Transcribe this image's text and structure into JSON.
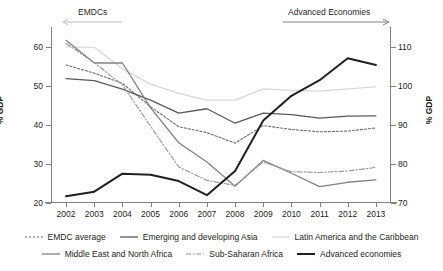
{
  "annotations": {
    "left": {
      "label": "EMDCs",
      "arrow": "arrow-left"
    },
    "right": {
      "label": "Advanced Economies",
      "arrow": "arrow-right"
    }
  },
  "axis": {
    "left_title": "% GDP",
    "right_title": "% GDP",
    "left_ticks": [
      "60",
      "50",
      "40",
      "30",
      "20"
    ],
    "right_ticks": [
      "110",
      "100",
      "90",
      "80",
      "70"
    ]
  },
  "chart_data": {
    "type": "line",
    "title": "",
    "xlabel": "",
    "ylabel": "% GDP",
    "y2label": "% GDP",
    "grid": false,
    "legend_position": "bottom",
    "categories": [
      "2002",
      "2003",
      "2004",
      "2005",
      "2006",
      "2007",
      "2008",
      "2009",
      "2010",
      "2011",
      "2012",
      "2013"
    ],
    "ylim": [
      20,
      65
    ],
    "y2lim": [
      70,
      115
    ],
    "left_tick_values": [
      20,
      30,
      40,
      50,
      60
    ],
    "right_tick_values": [
      70,
      80,
      90,
      100,
      110
    ],
    "series": [
      {
        "name": "EMDC average",
        "axis": "left",
        "style": "dotted",
        "color": "#6d6e71",
        "values": [
          55.3,
          53.2,
          50.6,
          44.6,
          39.5,
          38.0,
          35.3,
          39.8,
          38.8,
          38.2,
          38.4,
          39.2
        ]
      },
      {
        "name": "Emerging and developing Asia",
        "axis": "left",
        "style": "solid",
        "color": "#58595b",
        "values": [
          51.8,
          51.3,
          49.1,
          46.3,
          43.0,
          44.1,
          40.4,
          43.0,
          42.6,
          41.7,
          42.2,
          42.3
        ]
      },
      {
        "name": "Latin America and the Caribbean",
        "axis": "left",
        "style": "solid",
        "color": "#d7d8da",
        "values": [
          59.9,
          59.8,
          54.3,
          50.4,
          48.0,
          46.3,
          46.3,
          49.2,
          48.8,
          48.6,
          49.2,
          49.7
        ]
      },
      {
        "name": "Middle East and North Africa",
        "axis": "left",
        "style": "solid",
        "color": "#808285",
        "values": [
          61.6,
          55.8,
          55.8,
          44.3,
          35.4,
          30.5,
          24.3,
          30.9,
          27.6,
          24.2,
          25.3,
          25.9
        ]
      },
      {
        "name": "Sub-Saharan Africa",
        "axis": "left",
        "style": "dash-dot",
        "color": "#939598",
        "values": [
          60.8,
          55.9,
          50.2,
          39.6,
          29.2,
          25.8,
          24.5,
          30.5,
          28.0,
          27.8,
          28.2,
          29.1
        ]
      },
      {
        "name": "Advanced economies",
        "axis": "right",
        "style": "solid-thick",
        "color": "#231f20",
        "values": [
          71.7,
          72.9,
          77.5,
          77.2,
          75.6,
          72.0,
          78.2,
          91.1,
          97.4,
          101.4,
          107.0,
          105.3
        ]
      }
    ]
  },
  "legend": {
    "row1": [
      {
        "label": "EMDC average",
        "style": "dotted",
        "color": "#6d6e71"
      },
      {
        "label": "Emerging and developing Asia",
        "style": "solid",
        "color": "#58595b"
      },
      {
        "label": "Latin America and the Caribbean",
        "style": "solid",
        "color": "#d7d8da"
      }
    ],
    "row2": [
      {
        "label": "Middle East and North Africa",
        "style": "solid",
        "color": "#808285"
      },
      {
        "label": "Sub-Saharan Africa",
        "style": "dash-dot",
        "color": "#939598"
      },
      {
        "label": "Advanced economies",
        "style": "solid-thick",
        "color": "#231f20"
      }
    ]
  }
}
